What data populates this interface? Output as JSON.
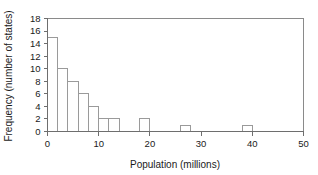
{
  "chart_data": {
    "type": "bar",
    "title": "",
    "subtitle": "",
    "xlabel": "Population (millions)",
    "ylabel": "Frequency (number of states)",
    "xlim": [
      0,
      50
    ],
    "ylim": [
      0,
      18
    ],
    "xticks": [
      0,
      10,
      20,
      30,
      40,
      50
    ],
    "xtick_labels": [
      "0",
      "10",
      "20",
      "30",
      "40",
      "50"
    ],
    "yticks": [
      0,
      2,
      4,
      6,
      8,
      10,
      12,
      14,
      16,
      18
    ],
    "ytick_labels": [
      "0",
      "2",
      "4",
      "6",
      "8",
      "10",
      "12",
      "14",
      "16",
      "18"
    ],
    "bin_width": 2,
    "grid": false,
    "legend": null,
    "bars": [
      {
        "bin_start": 0,
        "bin_end": 2,
        "value": 15
      },
      {
        "bin_start": 2,
        "bin_end": 4,
        "value": 10
      },
      {
        "bin_start": 4,
        "bin_end": 6,
        "value": 8
      },
      {
        "bin_start": 6,
        "bin_end": 8,
        "value": 6
      },
      {
        "bin_start": 8,
        "bin_end": 10,
        "value": 4
      },
      {
        "bin_start": 10,
        "bin_end": 12,
        "value": 2
      },
      {
        "bin_start": 12,
        "bin_end": 14,
        "value": 2
      },
      {
        "bin_start": 18,
        "bin_end": 20,
        "value": 2
      },
      {
        "bin_start": 26,
        "bin_end": 28,
        "value": 1
      },
      {
        "bin_start": 38,
        "bin_end": 40,
        "value": 1
      }
    ],
    "categories": [
      "0-2",
      "2-4",
      "4-6",
      "6-8",
      "8-10",
      "10-12",
      "12-14",
      "18-20",
      "26-28",
      "38-40"
    ],
    "values": [
      15,
      10,
      8,
      6,
      4,
      2,
      2,
      2,
      1,
      1
    ],
    "colors": {
      "bar_fill": "#ffffff",
      "bar_stroke": "#9a9a9a",
      "axis": "#6e6e6e",
      "frame": "#8a8a8a",
      "text": "#1a1a1a",
      "background": "#ffffff"
    }
  }
}
